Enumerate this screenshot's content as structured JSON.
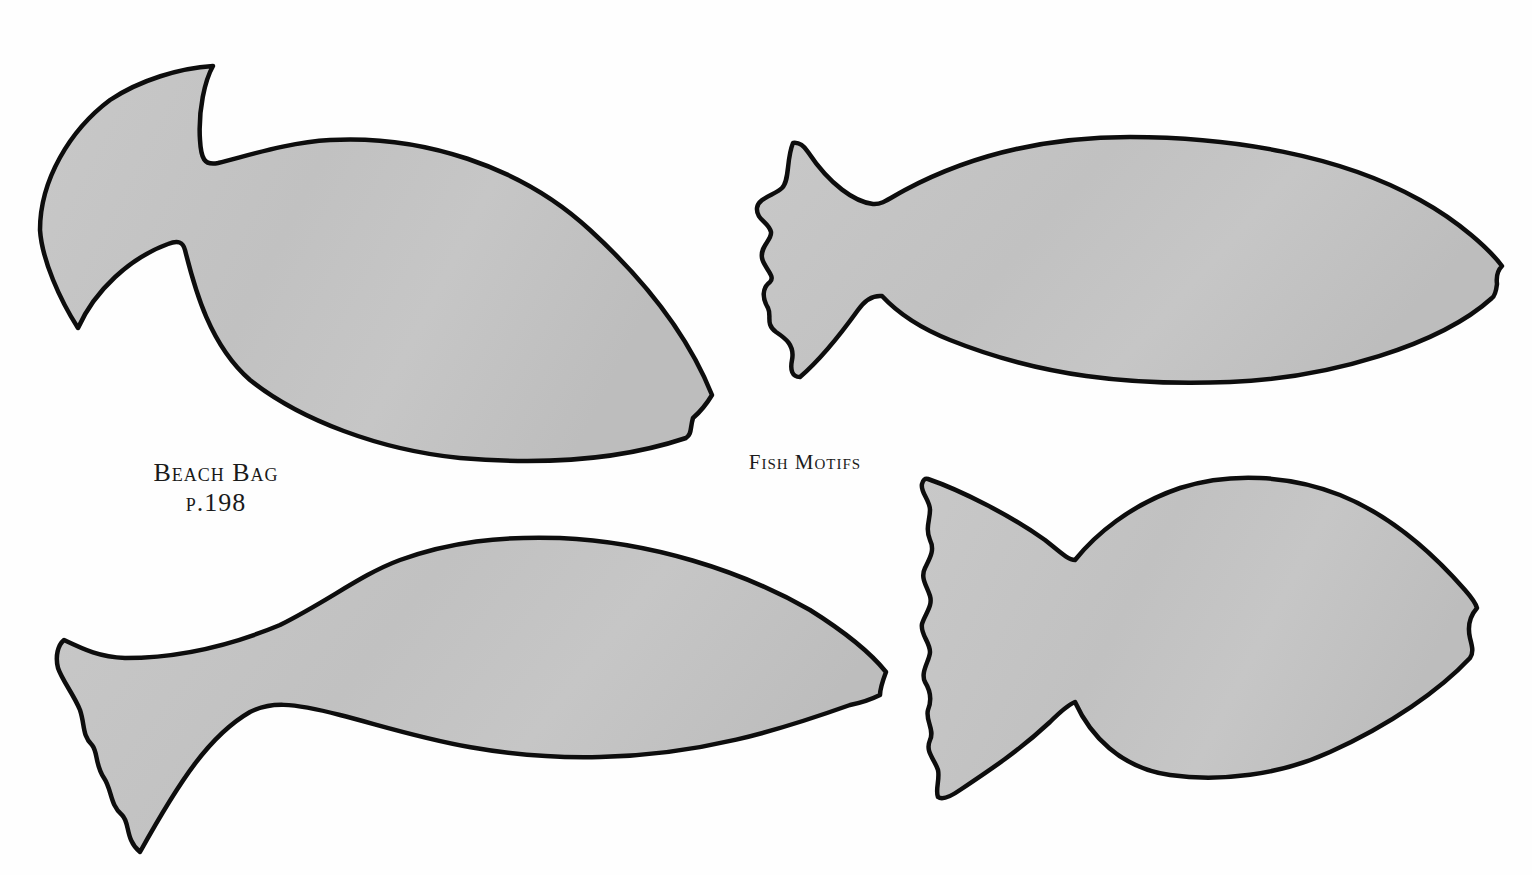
{
  "page": {
    "title": "Fish Motifs",
    "background_color": "#fefefe"
  },
  "labels": {
    "project_name": "Beach Bag",
    "page_ref": "p.198",
    "motif_title": "Fish Motifs"
  },
  "shapes": [
    {
      "id": "fish-1",
      "description": "Fish with curved hooked tail, facing right",
      "position": "top-left"
    },
    {
      "id": "fish-2",
      "description": "Long oval fish with ruffled tail, facing right",
      "position": "top-right"
    },
    {
      "id": "fish-3",
      "description": "Long arched fish with downward swept ruffled tail, facing right",
      "position": "bottom-left"
    },
    {
      "id": "fish-4",
      "description": "Round fish with scalloped triangular tail, facing right",
      "position": "bottom-right"
    }
  ],
  "colors": {
    "fill": "#c4c4c4",
    "outline": "#0d0d0d",
    "text": "#1a1a1a"
  }
}
